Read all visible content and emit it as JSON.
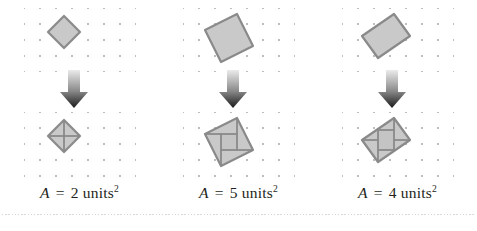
{
  "figure": {
    "background_color": "#ffffff",
    "panel_count": 3,
    "dot_grid": {
      "spacing_px": 16,
      "dot_color": "#bdbdbd",
      "columns": 7,
      "rows": 5
    },
    "shape_style": {
      "fill": "#c9c9c9",
      "stroke": "#8a8a8a",
      "inner_line": "#8a8a8a"
    },
    "arrow": {
      "name": "down-arrow",
      "gradient_from": "#e8e8e8",
      "gradient_to": "#1a1a1a"
    },
    "bottom_rule_color": "#d8d8dd"
  },
  "panels": [
    {
      "id": "panel-1",
      "top_shape": "rotated-square-tilt-1-1",
      "bottom_shape": "rotated-square-decomposed-4-triangles",
      "label": {
        "variable": "A",
        "equals": "=",
        "value": "2",
        "unit": "units",
        "exponent": "2",
        "full_text": "A = 2 units²"
      },
      "area_units": 2
    },
    {
      "id": "panel-2",
      "top_shape": "rotated-square-tilt-2-1",
      "bottom_shape": "rotated-square-decomposed-inner-square-and-4-triangles",
      "label": {
        "variable": "A",
        "equals": "=",
        "value": "5",
        "unit": "units",
        "exponent": "2",
        "full_text": "A = 5 units²"
      },
      "area_units": 5
    },
    {
      "id": "panel-3",
      "top_shape": "rotated-rectangle-tilt-2-1",
      "bottom_shape": "rotated-rectangle-decomposed-inner-square-and-4-triangles",
      "label": {
        "variable": "A",
        "equals": "=",
        "value": "4",
        "unit": "units",
        "exponent": "2",
        "full_text": "A = 4 units²"
      },
      "area_units": 4
    }
  ]
}
